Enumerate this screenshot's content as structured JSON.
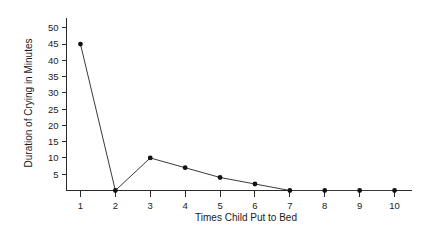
{
  "chart_data": {
    "type": "line",
    "title": "",
    "xlabel": "Times Child Put to Bed",
    "ylabel": "Duration of Crying in Minutes",
    "x": [
      1,
      2,
      3,
      4,
      5,
      6,
      7,
      8,
      9,
      10
    ],
    "values": [
      45,
      0,
      10,
      7,
      4,
      2,
      0,
      0,
      0,
      0
    ],
    "series": [
      {
        "name": "Duration of Crying",
        "values": [
          45,
          0,
          10,
          7,
          4,
          2,
          0,
          0,
          0,
          0
        ]
      }
    ],
    "xtick_labels": [
      "1",
      "2",
      "3",
      "4",
      "5",
      "6",
      "7",
      "8",
      "9",
      "10"
    ],
    "ytick_values": [
      5,
      10,
      15,
      20,
      25,
      30,
      35,
      40,
      45,
      50
    ],
    "ytick_labels": [
      "5",
      "10",
      "15",
      "20",
      "25",
      "30",
      "35",
      "40",
      "45",
      "50"
    ],
    "xlim": [
      0.6,
      10.5
    ],
    "ylim": [
      0,
      53
    ],
    "grid": false,
    "legend": false,
    "marker": "filled-circle",
    "line_color": "#3a3a3a",
    "marker_color": "#111111",
    "axis_color": "#2b2b2b",
    "background_color": "#ffffff"
  }
}
